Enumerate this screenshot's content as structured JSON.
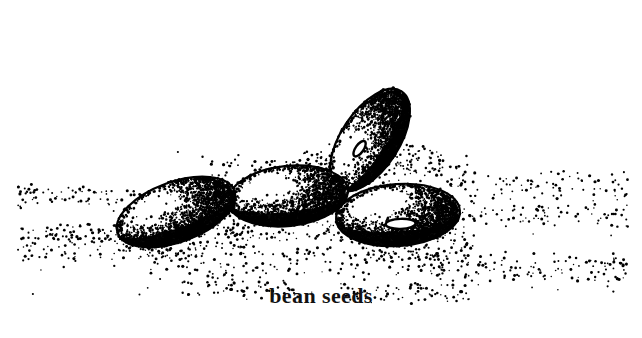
{
  "figure": {
    "title": "bean seeds",
    "caption": "bean seeds",
    "medium": "stippled pen-and-ink botanical illustration",
    "background_color": "#ffffff",
    "ink_color": "#000000",
    "width": 642,
    "height": 338
  },
  "caption": {
    "text": "bean seeds"
  },
  "subjects": [
    {
      "name": "bean-seed-left",
      "label": "bean seed (left, foreground)",
      "cx": 176,
      "cy": 212,
      "rx": 62,
      "ry": 30,
      "rotation": -20,
      "shading": "dark lower-left rim, light upper-left body",
      "hilum": false
    },
    {
      "name": "bean-seed-middle",
      "label": "bean seed (middle, foreground)",
      "cx": 288,
      "cy": 196,
      "rx": 60,
      "ry": 30,
      "rotation": -6,
      "shading": "light stipple overall, dark lower rim",
      "hilum": false
    },
    {
      "name": "bean-seed-upper-right",
      "label": "bean seed (upper right, tilted upright)",
      "cx": 370,
      "cy": 140,
      "rx": 58,
      "ry": 29,
      "rotation": -57,
      "shading": "dark left rim, graded stipple to the right",
      "hilum": true,
      "hilum_cx": 357,
      "hilum_cy": 136,
      "hilum_rx": 9,
      "hilum_ry": 4,
      "hilum_rotation": -55
    },
    {
      "name": "bean-seed-lower-right",
      "label": "bean seed (lower right, foreground)",
      "cx": 398,
      "cy": 215,
      "rx": 62,
      "ry": 31,
      "rotation": -4,
      "shading": "very dark rim, light stipple crown",
      "hilum": true,
      "hilum_cx": 400,
      "hilum_cy": 224,
      "hilum_rx": 15,
      "hilum_ry": 5,
      "hilum_rotation": -2
    }
  ],
  "ground": {
    "name": "stipple-ground-scatter",
    "label": "scattered stipple dots suggesting soil / ground plane",
    "extent_left": 18,
    "extent_right": 628,
    "band_top": 150,
    "band_bottom": 300
  }
}
